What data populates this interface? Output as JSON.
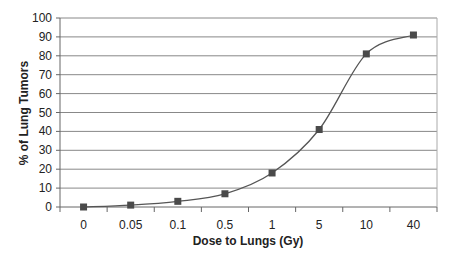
{
  "chart_data": {
    "type": "line",
    "title": "",
    "xlabel": "Dose to Lungs (Gy)",
    "ylabel": "% of Lung Tumors",
    "categories": [
      "0",
      "0.05",
      "0.1",
      "0.5",
      "1",
      "5",
      "10",
      "40"
    ],
    "series": [
      {
        "name": "% of Lung Tumors",
        "values": [
          0,
          1,
          3,
          7,
          18,
          41,
          81,
          91
        ],
        "marker": "square",
        "smooth": true,
        "color": "#555555"
      }
    ],
    "ylim": [
      0,
      100
    ],
    "yticks": [
      0,
      10,
      20,
      30,
      40,
      50,
      60,
      70,
      80,
      90,
      100
    ],
    "grid": {
      "horizontal": true,
      "vertical": false
    },
    "legend": null
  },
  "colors": {
    "line": "#555555",
    "marker": "#4a4a4a",
    "grid": "#888888",
    "axis": "#666666"
  }
}
